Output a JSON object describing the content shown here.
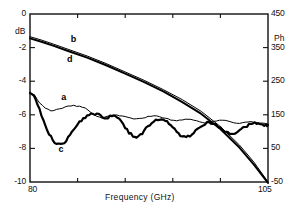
{
  "chart_data": {
    "type": "line",
    "title": "",
    "xlabel": "Frequency  (GHz)",
    "ylabel_left": "dB",
    "ylabel_right": "Ph",
    "xlim": [
      80,
      105
    ],
    "ylim_left": [
      -10,
      0
    ],
    "ylim_right": [
      -50,
      450
    ],
    "grid": false,
    "legend_position": "inline-annotations",
    "x_ticks": [
      80,
      105
    ],
    "x_tick_labels": [
      "80",
      "105"
    ],
    "x_minor_ticks": [
      85,
      90,
      95,
      100
    ],
    "y_ticks_left": [
      0,
      -2,
      -4,
      -6,
      -8,
      -10
    ],
    "y_tick_labels_left": [
      "0",
      "-2",
      "-4",
      "-6",
      "-8",
      "-10"
    ],
    "y_ticks_right": [
      450,
      350,
      250,
      150,
      50,
      -50
    ],
    "y_tick_labels_right": [
      "450",
      "350",
      "250",
      "150",
      "50",
      "-50"
    ],
    "annotations": [
      {
        "label": "b",
        "x": 84.6,
        "y": -1.55,
        "desc": "upper descending trace, thin"
      },
      {
        "label": "d",
        "x": 84.2,
        "y": -2.75,
        "desc": "upper descending trace, thick"
      },
      {
        "label": "a",
        "x": 83.6,
        "y": -5.0,
        "desc": "lower rippled trace, thin"
      },
      {
        "label": "c",
        "x": 83.3,
        "y": -8.1,
        "desc": "lower rippled trace, thick"
      }
    ],
    "series": [
      {
        "name": "b",
        "axis": "right",
        "style": "thin",
        "x": [
          80.0,
          81.2,
          82.5,
          84.0,
          86.0,
          88.0,
          90.0,
          92.0,
          94.0,
          96.0,
          98.0,
          100.0,
          102.0,
          103.5,
          105.0
        ],
        "y": [
          -1.35,
          -1.55,
          -1.8,
          -2.1,
          -2.5,
          -2.95,
          -3.45,
          -3.95,
          -4.5,
          -5.1,
          -5.8,
          -6.7,
          -7.8,
          -8.8,
          -10.0
        ]
      },
      {
        "name": "d",
        "axis": "right",
        "style": "thick",
        "x": [
          80.0,
          81.2,
          82.5,
          84.0,
          86.0,
          88.0,
          90.0,
          92.0,
          94.0,
          96.0,
          98.0,
          100.0,
          102.0,
          103.5,
          105.0
        ],
        "y": [
          -1.45,
          -1.65,
          -1.9,
          -2.2,
          -2.6,
          -3.05,
          -3.55,
          -4.05,
          -4.6,
          -5.25,
          -5.95,
          -6.85,
          -7.95,
          -8.95,
          -10.05
        ]
      },
      {
        "name": "a",
        "axis": "left",
        "style": "thin",
        "x": [
          80.0,
          80.5,
          81.0,
          81.6,
          82.2,
          82.8,
          83.4,
          84.0,
          84.6,
          85.2,
          85.8,
          86.4,
          87.0,
          87.6,
          88.2,
          88.8,
          89.4,
          90.0,
          90.6,
          91.2,
          91.8,
          92.4,
          93.0,
          93.6,
          94.2,
          94.8,
          95.4,
          96.0,
          96.6,
          97.2,
          97.8,
          98.4,
          99.0,
          99.6,
          100.2,
          100.8,
          101.4,
          102.0,
          102.6,
          103.2,
          103.8,
          104.4,
          105.0
        ],
        "y": [
          -4.7,
          -4.85,
          -5.3,
          -5.6,
          -5.75,
          -5.7,
          -5.6,
          -5.5,
          -5.45,
          -5.5,
          -5.6,
          -5.85,
          -6.1,
          -6.2,
          -6.1,
          -6.0,
          -6.05,
          -6.1,
          -6.2,
          -6.25,
          -6.2,
          -6.1,
          -6.05,
          -6.1,
          -6.2,
          -6.3,
          -6.35,
          -6.3,
          -6.25,
          -6.3,
          -6.4,
          -6.5,
          -6.45,
          -6.35,
          -6.3,
          -6.35,
          -6.45,
          -6.5,
          -6.45,
          -6.4,
          -6.45,
          -6.5,
          -6.55
        ]
      },
      {
        "name": "c",
        "axis": "left",
        "style": "thick-noisy",
        "x": [
          80.0,
          80.4,
          80.8,
          81.2,
          81.6,
          82.0,
          82.4,
          82.8,
          83.2,
          83.6,
          84.0,
          84.4,
          84.8,
          85.2,
          85.6,
          86.0,
          86.4,
          86.8,
          87.2,
          87.6,
          88.0,
          88.4,
          88.8,
          89.2,
          89.6,
          90.0,
          90.4,
          90.8,
          91.2,
          91.6,
          92.0,
          92.4,
          92.8,
          93.2,
          93.6,
          94.0,
          94.4,
          94.8,
          95.2,
          95.6,
          96.0,
          96.4,
          96.8,
          97.2,
          97.6,
          98.0,
          98.4,
          98.8,
          99.2,
          99.6,
          100.0,
          100.4,
          100.8,
          101.2,
          101.6,
          102.0,
          102.4,
          102.8,
          103.2,
          103.6,
          104.0,
          104.4,
          104.8,
          105.0
        ],
        "y": [
          -4.7,
          -4.9,
          -5.4,
          -6.0,
          -6.6,
          -7.1,
          -7.5,
          -7.75,
          -7.8,
          -7.65,
          -7.35,
          -7.0,
          -6.7,
          -6.45,
          -6.25,
          -6.1,
          -6.0,
          -5.95,
          -6.0,
          -6.15,
          -6.2,
          -6.1,
          -6.0,
          -6.1,
          -6.4,
          -6.75,
          -7.05,
          -7.25,
          -7.3,
          -7.2,
          -6.95,
          -6.7,
          -6.5,
          -6.35,
          -6.3,
          -6.35,
          -6.45,
          -6.6,
          -6.85,
          -7.1,
          -7.3,
          -7.35,
          -7.25,
          -7.05,
          -6.85,
          -6.65,
          -6.5,
          -6.45,
          -6.5,
          -6.6,
          -6.75,
          -6.95,
          -7.1,
          -7.15,
          -7.1,
          -6.95,
          -6.8,
          -6.65,
          -6.55,
          -6.5,
          -6.55,
          -6.6,
          -6.65,
          -6.6
        ]
      }
    ]
  },
  "axes": {
    "left_unit_label": "dB",
    "right_unit_label": "Ph",
    "x_title": "Frequency  (GHz)"
  }
}
